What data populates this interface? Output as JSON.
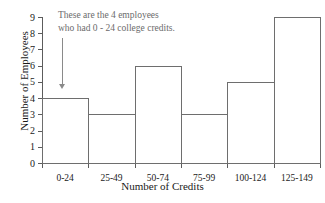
{
  "chart_data": {
    "type": "bar",
    "title": "",
    "categories": [
      "0-24",
      "25-49",
      "50-74",
      "75-99",
      "100-124",
      "125-149"
    ],
    "values": [
      4,
      3,
      6,
      3,
      5,
      9
    ],
    "xlabel": "Number of Credits",
    "ylabel": "Number of Employees",
    "ylim": [
      0,
      9
    ],
    "yticks": [
      "0",
      "1",
      "2",
      "3",
      "4",
      "5",
      "6",
      "7",
      "8",
      "9"
    ],
    "grid": false,
    "legend": null,
    "annotations": [
      {
        "line1": "These are the 4 employees",
        "line2": "who had 0 - 24 college credits.",
        "points_to_category": "0-24",
        "color": "#6b6b6b"
      }
    ],
    "colors": {
      "bar_fill": "#ffffff",
      "bar_edge": "#6e6e6e",
      "axis": "#5c5c5c",
      "text": "#1a1a1a",
      "annotation": "#6b6b6b"
    }
  }
}
